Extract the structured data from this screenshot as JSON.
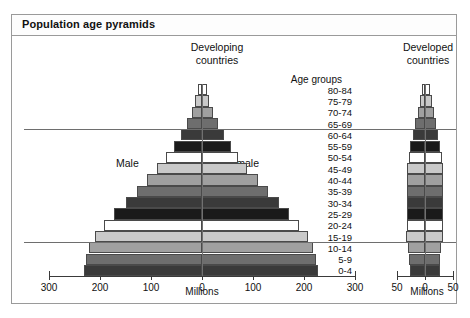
{
  "figure": {
    "title": "Population age pyramids"
  },
  "labels": {
    "age_groups_caption": "Age groups",
    "male": "Male",
    "female": "Female"
  },
  "panels": [
    {
      "id": "developing",
      "heading": "Developing\ncountries",
      "axis_title": "Millions",
      "ticks": [
        300,
        200,
        100,
        0,
        100,
        200,
        300
      ],
      "max": 300
    },
    {
      "id": "developed",
      "heading": "Developed\ncountries",
      "axis_title": "Millions",
      "ticks": [
        50,
        0,
        50
      ],
      "max": 50
    }
  ],
  "chart_data": {
    "type": "bar",
    "title": "Population age pyramids",
    "subtype": "population-pyramid",
    "xlabel": "Millions",
    "ylabel": "Age groups",
    "grid": false,
    "legend": [
      "Male",
      "Female"
    ],
    "categories": [
      "80-84",
      "75-79",
      "70-74",
      "65-69",
      "60-64",
      "55-59",
      "50-54",
      "45-49",
      "40-44",
      "35-39",
      "30-34",
      "25-29",
      "20-24",
      "15-19",
      "10-14",
      "5-9",
      "0-4"
    ],
    "annotations": [
      "Male",
      "Female",
      "Age groups"
    ],
    "reference_lines": [
      {
        "between": "65-69/60-64",
        "note": "upper horizontal rule"
      },
      {
        "between": "15-19/10-14",
        "note": "lower horizontal rule"
      }
    ],
    "panels": [
      {
        "name": "Developing countries",
        "xlim": [
          -300,
          300
        ],
        "xticks": [
          300,
          200,
          100,
          0,
          100,
          200,
          300
        ],
        "units": "Millions",
        "series": [
          {
            "name": "Male",
            "values": [
              8,
              13,
              20,
              30,
              42,
              55,
              70,
              88,
              108,
              128,
              150,
              172,
              192,
              210,
              222,
              228,
              232
            ]
          },
          {
            "name": "Female",
            "values": [
              9,
              14,
              21,
              31,
              43,
              56,
              71,
              89,
              109,
              129,
              150,
              171,
              190,
              207,
              218,
              224,
              228
            ]
          }
        ]
      },
      {
        "name": "Developed countries",
        "xlim": [
          -50,
          50
        ],
        "xticks": [
          50,
          0,
          50
        ],
        "units": "Millions",
        "series": [
          {
            "name": "Male",
            "values": [
              6,
              9,
              13,
              17,
              21,
              26,
              29,
              32,
              33,
              33,
              32,
              32,
              33,
              34,
              30,
              28,
              27
            ]
          },
          {
            "name": "Female",
            "values": [
              9,
              12,
              16,
              20,
              23,
              27,
              30,
              32,
              33,
              33,
              32,
              32,
              32,
              33,
              29,
              27,
              26
            ]
          }
        ]
      }
    ],
    "fill_cycle": [
      "#ffffff",
      "#c9c9c9",
      "#a0a0a0",
      "#6e6e6e",
      "#3a3a3a",
      "#1a1a1a"
    ]
  }
}
